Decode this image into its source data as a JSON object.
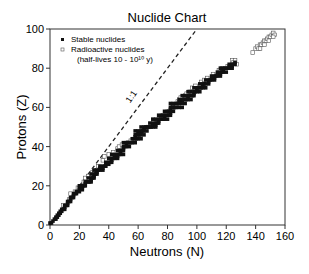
{
  "chart_data": {
    "type": "scatter",
    "title": "Nuclide Chart",
    "xlabel": "Neutrons (N)",
    "ylabel": "Protons (Z)",
    "xlim": [
      0,
      160
    ],
    "ylim": [
      0,
      100
    ],
    "xticks": [
      0,
      20,
      40,
      60,
      80,
      100,
      120,
      140,
      160
    ],
    "yticks": [
      0,
      20,
      40,
      60,
      80,
      100
    ],
    "grid": false,
    "legend_position": "upper-left",
    "legend": [
      {
        "label": "Stable nuclides",
        "marker": "filled-square"
      },
      {
        "label": "Radioactive nuclides",
        "marker": "open-square"
      },
      {
        "label": "(half-lives 10 - 10¹⁰ y)",
        "marker": "none"
      }
    ],
    "annotations": [
      {
        "text": "1:1",
        "type": "dashed-line",
        "from": [
          0,
          0
        ],
        "to": [
          100,
          100
        ]
      }
    ],
    "series": [
      {
        "name": "Stable nuclides",
        "marker": "filled-square",
        "points": [
          [
            0,
            1
          ],
          [
            1,
            1
          ],
          [
            2,
            2
          ],
          [
            3,
            3
          ],
          [
            4,
            3
          ],
          [
            4,
            4
          ],
          [
            5,
            4
          ],
          [
            5,
            5
          ],
          [
            6,
            5
          ],
          [
            6,
            6
          ],
          [
            7,
            6
          ],
          [
            7,
            7
          ],
          [
            8,
            7
          ],
          [
            8,
            8
          ],
          [
            9,
            8
          ],
          [
            10,
            8
          ],
          [
            10,
            9
          ],
          [
            10,
            10
          ],
          [
            11,
            10
          ],
          [
            12,
            10
          ],
          [
            12,
            11
          ],
          [
            12,
            12
          ],
          [
            13,
            12
          ],
          [
            14,
            12
          ],
          [
            14,
            13
          ],
          [
            14,
            14
          ],
          [
            15,
            14
          ],
          [
            16,
            14
          ],
          [
            16,
            15
          ],
          [
            16,
            16
          ],
          [
            17,
            16
          ],
          [
            18,
            16
          ],
          [
            18,
            17
          ],
          [
            20,
            17
          ],
          [
            20,
            18
          ],
          [
            22,
            18
          ],
          [
            20,
            19
          ],
          [
            21,
            19
          ],
          [
            22,
            19
          ],
          [
            20,
            20
          ],
          [
            22,
            20
          ],
          [
            23,
            20
          ],
          [
            24,
            20
          ],
          [
            24,
            21
          ],
          [
            24,
            22
          ],
          [
            25,
            22
          ],
          [
            26,
            22
          ],
          [
            27,
            22
          ],
          [
            28,
            22
          ],
          [
            28,
            23
          ],
          [
            26,
            24
          ],
          [
            28,
            24
          ],
          [
            29,
            24
          ],
          [
            30,
            24
          ],
          [
            30,
            25
          ],
          [
            28,
            26
          ],
          [
            30,
            26
          ],
          [
            31,
            26
          ],
          [
            32,
            26
          ],
          [
            32,
            27
          ],
          [
            30,
            28
          ],
          [
            32,
            28
          ],
          [
            33,
            28
          ],
          [
            34,
            28
          ],
          [
            36,
            28
          ],
          [
            34,
            29
          ],
          [
            36,
            29
          ],
          [
            34,
            30
          ],
          [
            36,
            30
          ],
          [
            37,
            30
          ],
          [
            38,
            30
          ],
          [
            38,
            31
          ],
          [
            40,
            31
          ],
          [
            38,
            32
          ],
          [
            40,
            32
          ],
          [
            41,
            32
          ],
          [
            42,
            32
          ],
          [
            42,
            33
          ],
          [
            40,
            34
          ],
          [
            42,
            34
          ],
          [
            43,
            34
          ],
          [
            44,
            34
          ],
          [
            46,
            34
          ],
          [
            44,
            35
          ],
          [
            46,
            35
          ],
          [
            42,
            36
          ],
          [
            44,
            36
          ],
          [
            46,
            36
          ],
          [
            47,
            36
          ],
          [
            48,
            36
          ],
          [
            50,
            36
          ],
          [
            48,
            37
          ],
          [
            46,
            38
          ],
          [
            48,
            38
          ],
          [
            49,
            38
          ],
          [
            50,
            38
          ],
          [
            50,
            39
          ],
          [
            50,
            40
          ],
          [
            51,
            40
          ],
          [
            52,
            40
          ],
          [
            54,
            40
          ],
          [
            52,
            41
          ],
          [
            50,
            42
          ],
          [
            52,
            42
          ],
          [
            53,
            42
          ],
          [
            54,
            42
          ],
          [
            55,
            42
          ],
          [
            56,
            42
          ],
          [
            58,
            42
          ],
          [
            56,
            44
          ],
          [
            57,
            44
          ],
          [
            58,
            44
          ],
          [
            59,
            44
          ],
          [
            60,
            44
          ],
          [
            62,
            44
          ],
          [
            58,
            45
          ],
          [
            58,
            46
          ],
          [
            59,
            46
          ],
          [
            60,
            46
          ],
          [
            61,
            46
          ],
          [
            62,
            46
          ],
          [
            64,
            46
          ],
          [
            60,
            47
          ],
          [
            62,
            47
          ],
          [
            58,
            48
          ],
          [
            60,
            48
          ],
          [
            62,
            48
          ],
          [
            63,
            48
          ],
          [
            64,
            48
          ],
          [
            66,
            48
          ],
          [
            64,
            49
          ],
          [
            62,
            50
          ],
          [
            64,
            50
          ],
          [
            65,
            50
          ],
          [
            66,
            50
          ],
          [
            67,
            50
          ],
          [
            68,
            50
          ],
          [
            69,
            50
          ],
          [
            70,
            50
          ],
          [
            72,
            50
          ],
          [
            70,
            51
          ],
          [
            72,
            51
          ],
          [
            68,
            52
          ],
          [
            70,
            52
          ],
          [
            72,
            52
          ],
          [
            73,
            52
          ],
          [
            74,
            52
          ],
          [
            74,
            53
          ],
          [
            70,
            54
          ],
          [
            72,
            54
          ],
          [
            74,
            54
          ],
          [
            75,
            54
          ],
          [
            76,
            54
          ],
          [
            77,
            54
          ],
          [
            78,
            54
          ],
          [
            80,
            54
          ],
          [
            78,
            55
          ],
          [
            74,
            56
          ],
          [
            76,
            56
          ],
          [
            78,
            56
          ],
          [
            79,
            56
          ],
          [
            80,
            56
          ],
          [
            81,
            56
          ],
          [
            82,
            56
          ],
          [
            82,
            57
          ],
          [
            78,
            58
          ],
          [
            80,
            58
          ],
          [
            82,
            58
          ],
          [
            84,
            58
          ],
          [
            82,
            59
          ],
          [
            82,
            60
          ],
          [
            83,
            60
          ],
          [
            84,
            60
          ],
          [
            85,
            60
          ],
          [
            86,
            60
          ],
          [
            88,
            60
          ],
          [
            90,
            60
          ],
          [
            82,
            62
          ],
          [
            84,
            62
          ],
          [
            86,
            62
          ],
          [
            87,
            62
          ],
          [
            88,
            62
          ],
          [
            90,
            62
          ],
          [
            92,
            62
          ],
          [
            88,
            63
          ],
          [
            90,
            63
          ],
          [
            88,
            64
          ],
          [
            90,
            64
          ],
          [
            91,
            64
          ],
          [
            92,
            64
          ],
          [
            93,
            64
          ],
          [
            94,
            64
          ],
          [
            96,
            64
          ],
          [
            94,
            65
          ],
          [
            90,
            66
          ],
          [
            92,
            66
          ],
          [
            94,
            66
          ],
          [
            95,
            66
          ],
          [
            96,
            66
          ],
          [
            97,
            66
          ],
          [
            98,
            66
          ],
          [
            98,
            67
          ],
          [
            94,
            68
          ],
          [
            96,
            68
          ],
          [
            98,
            68
          ],
          [
            99,
            68
          ],
          [
            100,
            68
          ],
          [
            102,
            68
          ],
          [
            100,
            69
          ],
          [
            98,
            70
          ],
          [
            100,
            70
          ],
          [
            101,
            70
          ],
          [
            102,
            70
          ],
          [
            103,
            70
          ],
          [
            104,
            70
          ],
          [
            106,
            70
          ],
          [
            104,
            71
          ],
          [
            102,
            72
          ],
          [
            104,
            72
          ],
          [
            105,
            72
          ],
          [
            106,
            72
          ],
          [
            108,
            72
          ],
          [
            108,
            73
          ],
          [
            106,
            74
          ],
          [
            108,
            74
          ],
          [
            109,
            74
          ],
          [
            110,
            74
          ],
          [
            112,
            74
          ],
          [
            110,
            75
          ],
          [
            112,
            75
          ],
          [
            110,
            76
          ],
          [
            112,
            76
          ],
          [
            113,
            76
          ],
          [
            114,
            76
          ],
          [
            116,
            76
          ],
          [
            114,
            77
          ],
          [
            116,
            77
          ],
          [
            114,
            78
          ],
          [
            116,
            78
          ],
          [
            117,
            78
          ],
          [
            118,
            78
          ],
          [
            120,
            78
          ],
          [
            118,
            79
          ],
          [
            116,
            80
          ],
          [
            118,
            80
          ],
          [
            119,
            80
          ],
          [
            120,
            80
          ],
          [
            121,
            80
          ],
          [
            122,
            80
          ],
          [
            124,
            80
          ],
          [
            122,
            81
          ],
          [
            124,
            81
          ],
          [
            122,
            82
          ],
          [
            124,
            82
          ],
          [
            125,
            82
          ],
          [
            126,
            82
          ],
          [
            126,
            83
          ]
        ]
      },
      {
        "name": "Radioactive nuclides (half-lives 10 - 10¹⁰ y)",
        "marker": "open-square",
        "points": [
          [
            9,
            10
          ],
          [
            13,
            13
          ],
          [
            14,
            16
          ],
          [
            17,
            17
          ],
          [
            19,
            19
          ],
          [
            21,
            19
          ],
          [
            23,
            22
          ],
          [
            24,
            24
          ],
          [
            26,
            25
          ],
          [
            29,
            27
          ],
          [
            30,
            28
          ],
          [
            33,
            30
          ],
          [
            36,
            33
          ],
          [
            37,
            35
          ],
          [
            40,
            36
          ],
          [
            43,
            37
          ],
          [
            46,
            39
          ],
          [
            47,
            40
          ],
          [
            49,
            41
          ],
          [
            51,
            41
          ],
          [
            53,
            42
          ],
          [
            55,
            43
          ],
          [
            57,
            43
          ],
          [
            59,
            45
          ],
          [
            61,
            47
          ],
          [
            63,
            48
          ],
          [
            65,
            49
          ],
          [
            67,
            50
          ],
          [
            70,
            51
          ],
          [
            73,
            53
          ],
          [
            76,
            55
          ],
          [
            77,
            56
          ],
          [
            79,
            57
          ],
          [
            81,
            58
          ],
          [
            83,
            59
          ],
          [
            84,
            60
          ],
          [
            86,
            61
          ],
          [
            87,
            63
          ],
          [
            88,
            64
          ],
          [
            89,
            65
          ],
          [
            92,
            66
          ],
          [
            93,
            67
          ],
          [
            95,
            68
          ],
          [
            97,
            70
          ],
          [
            99,
            71
          ],
          [
            102,
            71
          ],
          [
            103,
            73
          ],
          [
            105,
            74
          ],
          [
            107,
            75
          ],
          [
            111,
            77
          ],
          [
            115,
            79
          ],
          [
            117,
            80
          ],
          [
            121,
            81
          ],
          [
            124,
            84
          ],
          [
            125,
            83
          ],
          [
            126,
            84
          ],
          [
            127,
            82
          ],
          [
            138,
            88
          ],
          [
            140,
            90
          ],
          [
            141,
            91
          ],
          [
            142,
            90
          ],
          [
            143,
            92
          ],
          [
            144,
            92
          ],
          [
            145,
            93
          ],
          [
            146,
            94
          ],
          [
            147,
            94
          ],
          [
            148,
            95
          ],
          [
            149,
            96
          ],
          [
            150,
            96
          ],
          [
            151,
            97
          ],
          [
            152,
            98
          ],
          [
            153,
            97
          ],
          [
            149,
            94
          ],
          [
            146,
            92
          ],
          [
            143,
            90
          ],
          [
            152,
            96
          ]
        ]
      }
    ]
  }
}
